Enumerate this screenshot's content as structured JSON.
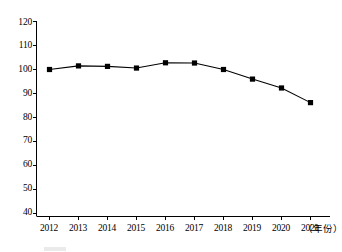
{
  "chart_data": {
    "type": "line",
    "title": "",
    "subtitle": "",
    "xlabel": "（年份）",
    "ylabel": "",
    "categories": [
      "2012",
      "2013",
      "2014",
      "2015",
      "2016",
      "2017",
      "2018",
      "2019",
      "2020",
      "2021"
    ],
    "values": [
      100.0,
      101.5,
      101.3,
      100.6,
      102.8,
      102.7,
      100.0,
      96.0,
      92.3,
      86.2
    ],
    "series": [
      {
        "name": "",
        "values": [
          100.0,
          101.5,
          101.3,
          100.6,
          102.8,
          102.7,
          100.0,
          96.0,
          92.3,
          86.2
        ]
      }
    ],
    "ylim": [
      40,
      120
    ],
    "ytick_labels": [
      "120",
      "110",
      "100",
      "90",
      "80",
      "70",
      "60",
      "50",
      "40"
    ],
    "ytick_values": [
      120,
      110,
      100,
      90,
      80,
      70,
      60,
      50,
      40
    ],
    "xtick_labels": [
      "2012",
      "2013",
      "2014",
      "2015",
      "2016",
      "2017",
      "2018",
      "2019",
      "2020",
      "2021"
    ],
    "grid": false,
    "legend_position": "none",
    "marker": "square",
    "line_color": "#000000",
    "marker_color": "#000000",
    "axis_color": "#000000",
    "background_color": "#ffffff"
  },
  "axes": {
    "y_axis_name": "y-axis",
    "x_axis_name": "x-axis"
  }
}
